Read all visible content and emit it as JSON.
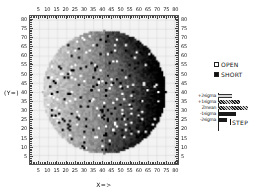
{
  "axes": {
    "x_label": "X=>",
    "y_label": "(Y=)",
    "ticks": [
      5,
      10,
      15,
      20,
      25,
      30,
      35,
      40,
      45,
      50,
      55,
      60,
      65,
      70,
      75,
      80
    ],
    "x_min": 0,
    "x_max": 82,
    "y_min": 0,
    "y_max": 82
  },
  "legend": {
    "items": [
      {
        "label": "OPEN",
        "marker": "open-square-icon",
        "color": "#ffffff"
      },
      {
        "label": "SHORT",
        "marker": "filled-square-icon",
        "color": "#101010"
      }
    ]
  },
  "histogram": {
    "step_label": "STEP",
    "rows": [
      {
        "label": "+2sigma",
        "value": 14,
        "fill": "light"
      },
      {
        "label": "+1sigma",
        "value": 22,
        "fill": "mid"
      },
      {
        "label": "Zmean",
        "value": 30,
        "fill": "mid"
      },
      {
        "label": "-1sigma",
        "value": 18,
        "fill": "solid"
      },
      {
        "label": "-2sigma",
        "value": 9,
        "fill": "solid"
      }
    ]
  },
  "chart_data": {
    "type": "heatmap",
    "xlabel": "X=>",
    "ylabel": "(Y=)",
    "xlim": [
      0,
      82
    ],
    "ylim": [
      0,
      82
    ],
    "grid": true,
    "tick_labels_x": [
      5,
      10,
      15,
      20,
      25,
      30,
      35,
      40,
      45,
      50,
      55,
      60,
      65,
      70,
      75,
      80
    ],
    "tick_labels_y": [
      5,
      10,
      15,
      20,
      25,
      30,
      35,
      40,
      45,
      50,
      55,
      60,
      65,
      70,
      75,
      80
    ],
    "wafer": {
      "center_x": 41,
      "center_y": 40,
      "radius": 34,
      "cell_size": 1
    },
    "value_gradient": {
      "description": "grayscale value increases left-to-right across wafer",
      "left_gray": 210,
      "right_gray": 25,
      "noise_amplitude": 45
    },
    "defects": {
      "open_count": 120,
      "short_count": 140
    },
    "legend_entries": [
      "OPEN",
      "SHORT"
    ],
    "legend_position": "right",
    "sigma_bands": [
      "+2sigma",
      "+1sigma",
      "Zmean",
      "-1sigma",
      "-2sigma"
    ],
    "sigma_counts": [
      14,
      22,
      30,
      18,
      9
    ]
  }
}
